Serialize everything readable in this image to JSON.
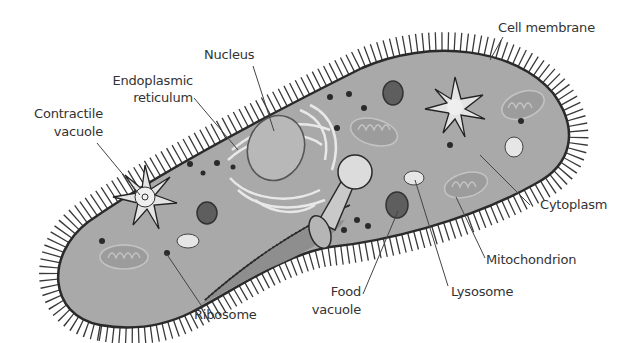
{
  "diagram": {
    "colors": {
      "background": "#ffffff",
      "cytoplasm": "#a8a8a8",
      "membrane": "#2e2e2e",
      "organelle_light": "#e6e6e6",
      "organelle_dark": "#5e5e5e",
      "mitochondrion": "#9a9a9a",
      "text": "#333333"
    },
    "labels": {
      "cell_membrane": "Cell membrane",
      "nucleus": "Nucleus",
      "er_line1": "Endoplasmic",
      "er_line2": "reticulum",
      "cv_line1": "Contractile",
      "cv_line2": "vacuole",
      "cytoplasm": "Cytoplasm",
      "mitochondrion": "Mitochondrion",
      "lysosome": "Lysosome",
      "fv_line1": "Food",
      "fv_line2": "vacuole",
      "ribosome": "Ribosome"
    }
  }
}
